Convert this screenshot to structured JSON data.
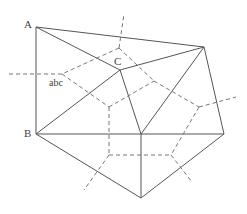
{
  "diagram": {
    "type": "triangulation-with-voronoi-dual",
    "labels": {
      "A": "A",
      "B": "B",
      "C": "C",
      "edge": "abc"
    },
    "vertices": {
      "A": [
        36,
        27
      ],
      "B": [
        36,
        134
      ],
      "C": [
        120,
        70
      ],
      "TR": [
        204,
        47
      ],
      "M": [
        141,
        134
      ],
      "R": [
        224,
        134
      ],
      "BOT": [
        141,
        198
      ]
    },
    "solid_edges": [
      [
        "A",
        "TR"
      ],
      [
        "A",
        "C"
      ],
      [
        "A",
        "B"
      ],
      [
        "B",
        "C"
      ],
      [
        "B",
        "M"
      ],
      [
        "B",
        "BOT"
      ],
      [
        "C",
        "TR"
      ],
      [
        "C",
        "M"
      ],
      [
        "TR",
        "M"
      ],
      [
        "TR",
        "R"
      ],
      [
        "M",
        "R"
      ],
      [
        "M",
        "BOT"
      ],
      [
        "R",
        "BOT"
      ]
    ],
    "dashed_nodes": {
      "n1": [
        119,
        48
      ],
      "n2": [
        62,
        74
      ],
      "n3": [
        109,
        107
      ],
      "n4": [
        154,
        81
      ],
      "n5": [
        199,
        107
      ],
      "n6": [
        109,
        155
      ],
      "n7": [
        171,
        155
      ]
    },
    "dashed_edges": [
      [
        [
          119,
          48
        ],
        [
          124,
          14
        ]
      ],
      [
        [
          119,
          48
        ],
        [
          62,
          74
        ]
      ],
      [
        [
          119,
          48
        ],
        [
          154,
          81
        ]
      ],
      [
        [
          62,
          74
        ],
        [
          8,
          74
        ]
      ],
      [
        [
          62,
          74
        ],
        [
          109,
          107
        ]
      ],
      [
        [
          109,
          107
        ],
        [
          154,
          81
        ]
      ],
      [
        [
          109,
          107
        ],
        [
          109,
          155
        ]
      ],
      [
        [
          154,
          81
        ],
        [
          199,
          107
        ]
      ],
      [
        [
          199,
          107
        ],
        [
          236,
          97
        ]
      ],
      [
        [
          199,
          107
        ],
        [
          171,
          155
        ]
      ],
      [
        [
          109,
          155
        ],
        [
          171,
          155
        ]
      ],
      [
        [
          109,
          155
        ],
        [
          84,
          190
        ]
      ],
      [
        [
          171,
          155
        ],
        [
          192,
          182
        ]
      ]
    ]
  }
}
